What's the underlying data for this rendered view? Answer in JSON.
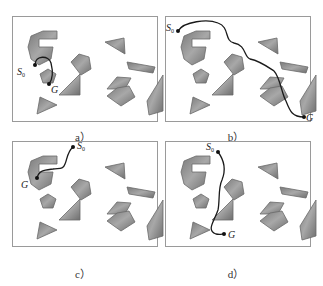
{
  "figure": {
    "panels": [
      {
        "id": "a",
        "caption": "a）",
        "start_label": "S",
        "start_sub": "0",
        "goal_label": "G",
        "start": [
          22,
          48
        ],
        "goal": [
          36,
          67
        ],
        "path": "M22,48 C22,38 36,38 38,46 C40,54 40,62 36,67",
        "start_label_pos": [
          4,
          58
        ],
        "goal_label_pos": [
          38,
          76
        ]
      },
      {
        "id": "b",
        "caption": "b）",
        "start_label": "S",
        "start_sub": "0",
        "goal_label": "G",
        "start": [
          12,
          14
        ],
        "goal": [
          138,
          100
        ],
        "path": "M12,14 C18,4 42,2 52,6 C64,10 58,24 68,26 C80,28 78,40 84,42 C94,44 102,50 108,54 C114,60 116,78 120,84 C124,94 126,100 138,100",
        "start_label_pos": [
          0,
          14
        ],
        "goal_label_pos": [
          140,
          104
        ]
      },
      {
        "id": "c",
        "caption": "c）",
        "start_label": "S",
        "start_sub": "0",
        "goal_label": "G",
        "start": [
          60,
          5
        ],
        "goal": [
          24,
          36
        ],
        "path": "M60,5 C54,10 54,18 52,22 C50,28 46,26 40,27 C32,28 26,28 24,36",
        "start_label_pos": [
          64,
          7
        ],
        "goal_label_pos": [
          8,
          46
        ]
      },
      {
        "id": "d",
        "caption": "d）",
        "start_label": "S",
        "start_sub": "0",
        "goal_label": "G",
        "start": [
          52,
          10
        ],
        "goal": [
          58,
          92
        ],
        "path": "M52,10 C58,18 60,28 56,38 C52,46 54,58 52,68 C48,80 40,88 50,92 C54,93 56,92 58,92",
        "start_label_pos": [
          40,
          8
        ],
        "goal_label_pos": [
          62,
          96
        ]
      }
    ],
    "obstacles": [
      "M18,19 L30,14 L44,14 L44,22 L26,22 L26,30 L40,30 L38,42 L26,48 L18,42 L15,30 Z",
      "M58,45 L66,37 L76,40 L78,52 L68,58 Z",
      "M92,25 L111,21 L112,37 Z",
      "M114,45 L142,50 L140,56 L116,52 Z",
      "M94,72 L104,60 L118,61 L112,72 Z",
      "M27,57 L35,52 L43,57 L40,66 L30,66 Z",
      "M46,78 L67,57 L67,78 Z",
      "M94,79 L104,71 L116,69 L122,80 L108,89 Z",
      "M136,98 L134,84 L150,58 L150,94 Z",
      "M24,97 L27,80 L44,88 Z"
    ],
    "colors": {
      "obstacle_fill": "#8c8c8c",
      "obstacle_stroke": "#6a6a6a",
      "path": "#1a1a1a",
      "border": "#9a9a9a"
    }
  }
}
